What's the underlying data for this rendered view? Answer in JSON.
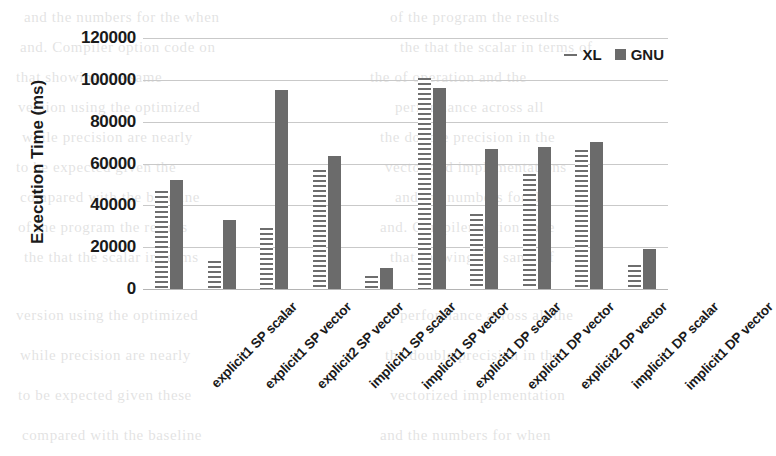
{
  "chart_data": {
    "type": "bar",
    "title": "",
    "xlabel": "",
    "ylabel": "Execution Time (ms)",
    "ylim": [
      0,
      120000
    ],
    "yticks": [
      120000,
      100000,
      80000,
      60000,
      40000,
      20000,
      0
    ],
    "ytick_labels": [
      "120000",
      "100000",
      "80000",
      "60000",
      "40000",
      "20000",
      "0"
    ],
    "grid": true,
    "legend_position": "top-right",
    "categories": [
      "explicit1 SP scalar",
      "explicit1 SP vector",
      "explicit2 SP vector",
      "implicit1 SP scalar",
      "implicit1 SP vector",
      "explicit1 DP scalar",
      "explicit1 DP vector",
      "explicit2 DP vector",
      "implicit1 DP scalar",
      "implicit1 DP vector"
    ],
    "series": [
      {
        "name": "XL",
        "color": "#6e6e6e",
        "pattern": "horizontal-lines",
        "values": [
          47000,
          13500,
          29000,
          57000,
          6000,
          101000,
          36000,
          55000,
          66500,
          11500
        ]
      },
      {
        "name": "GNU",
        "color": "#6b6b6b",
        "pattern": "solid",
        "values": [
          52000,
          33000,
          95000,
          63500,
          10000,
          96000,
          67000,
          68000,
          70500,
          19000
        ]
      }
    ]
  },
  "legend": {
    "entries": [
      {
        "label": "XL",
        "marker": "line"
      },
      {
        "label": "GNU",
        "marker": "square"
      }
    ]
  },
  "page_bleed": {
    "lines": [
      "and the numbers for the when",
      "of the program the results",
      "and. Compiler option code on",
      "the that the scalar in terms of",
      "that showing the same",
      "the of operation and the",
      "version using the optimized",
      "performance across all",
      "while precision are nearly",
      "the double precision in the",
      "to be expected given the",
      "vectorized implementations",
      "compared with the baseline"
    ]
  }
}
